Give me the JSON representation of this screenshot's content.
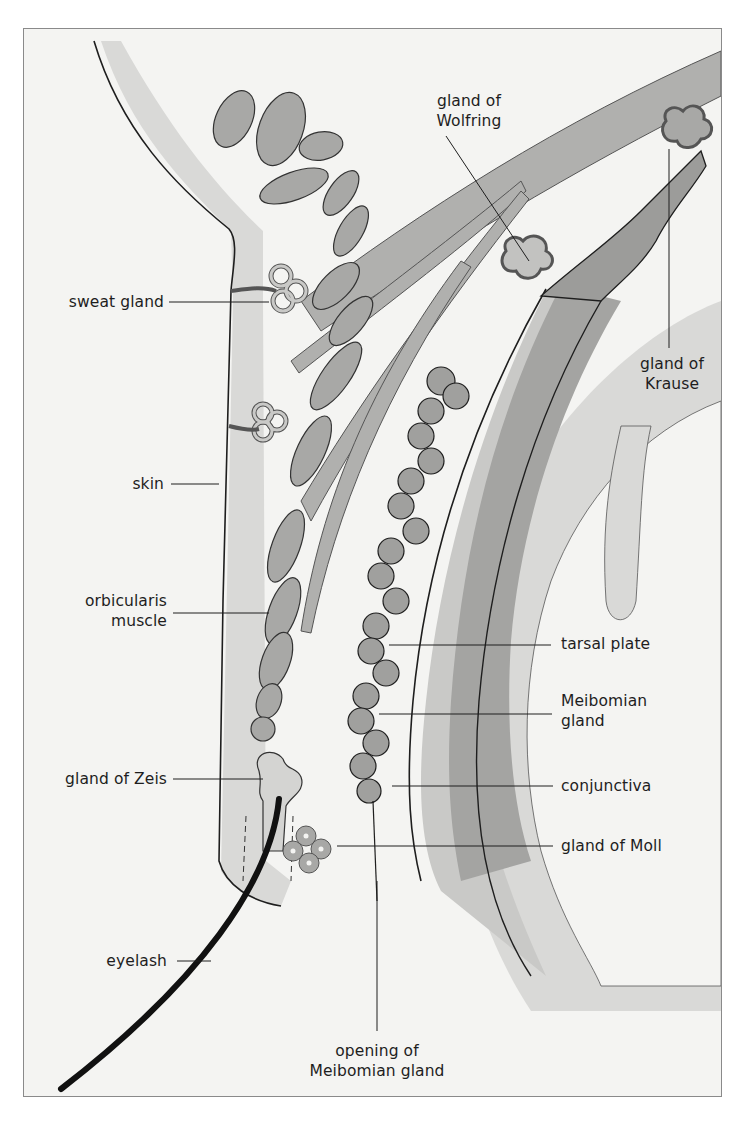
{
  "diagram": {
    "colors": {
      "background": "#f4f4f2",
      "light_tissue": "#d9d9d7",
      "mid_tissue": "#b2b2b0",
      "dark_tissue": "#9c9c9a",
      "outline": "#1e1e1e",
      "eyelash": "#111111"
    },
    "labels": {
      "gland_of_wolfring": {
        "line1": "gland of",
        "line2": "Wolfring"
      },
      "gland_of_krause": {
        "line1": "gland of",
        "line2": "Krause"
      },
      "sweat_gland": "sweat gland",
      "skin": "skin",
      "orbicularis_muscle": {
        "line1": "orbicularis",
        "line2": "muscle"
      },
      "tarsal_plate": "tarsal plate",
      "meibomian_gland": {
        "line1": "Meibomian",
        "line2": "gland"
      },
      "gland_of_zeis": "gland of Zeis",
      "conjunctiva": "conjunctiva",
      "gland_of_moll": "gland of Moll",
      "eyelash": "eyelash",
      "opening_of_meibomian_gland": {
        "line1": "opening of",
        "line2": "Meibomian gland"
      }
    }
  }
}
